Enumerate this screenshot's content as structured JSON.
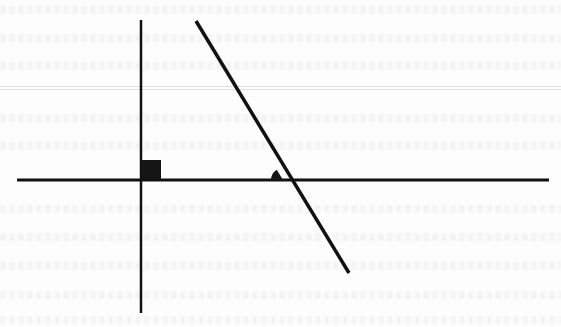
{
  "diagram": {
    "colors": {
      "background": "#fdfdfd",
      "ink": "#111111",
      "bleed_through": "#bdbdbd"
    },
    "horizontal_line": {
      "x1": 17,
      "y1": 180,
      "x2": 549,
      "y2": 180,
      "stroke_width": 3
    },
    "vertical_line": {
      "x1": 141,
      "y1": 20,
      "x2": 141,
      "y2": 313,
      "stroke_width": 2.5
    },
    "transversal_line": {
      "x1": 196,
      "y1": 21,
      "x2": 349,
      "y2": 273,
      "stroke_width": 3.5
    },
    "right_angle_marker": {
      "x": 142,
      "y": 160,
      "size": 19,
      "type": "filled-square"
    },
    "angle_marker": {
      "cx": 283,
      "cy": 180,
      "radius": 12,
      "type": "filled-sector",
      "position": "above-left of intersection"
    },
    "background_text": "illegible bleed-through text from reverse side of page"
  }
}
